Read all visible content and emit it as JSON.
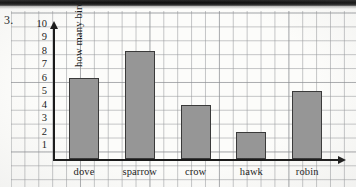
{
  "worksheet": {
    "question_number": "3."
  },
  "chart_data": {
    "type": "bar",
    "title": "",
    "xlabel": "",
    "ylabel": "how many birds",
    "categories": [
      "dove",
      "sparrow",
      "crow",
      "hawk",
      "robin"
    ],
    "values": [
      6,
      8,
      4,
      2,
      5
    ],
    "ylim": [
      0,
      10
    ],
    "ytick_labels": [
      "10",
      "9",
      "8",
      "7",
      "6",
      "5",
      "4",
      "3",
      "2",
      "1"
    ],
    "ytick_values": [
      10,
      9,
      8,
      7,
      6,
      5,
      4,
      3,
      2,
      1
    ],
    "grid": true,
    "legend": false,
    "bar_color": "#969696",
    "bar_edge_color": "#3a3a3a",
    "axis_color": "#1a1a1a",
    "grid_color": "#96989b"
  }
}
